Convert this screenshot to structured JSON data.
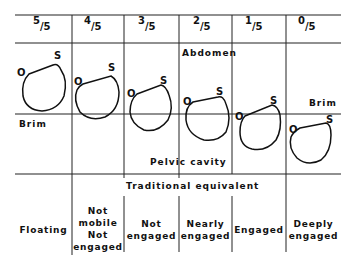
{
  "diagram": {
    "columns": [
      {
        "num": "5",
        "den": "/5",
        "equivalent": [
          "Floating"
        ]
      },
      {
        "num": "4",
        "den": "/5",
        "equivalent": [
          "Not",
          "mobile",
          "Not",
          "engaged"
        ]
      },
      {
        "num": "3",
        "den": "/5",
        "equivalent": [
          "Not",
          "engaged"
        ]
      },
      {
        "num": "2",
        "den": "/5",
        "equivalent": [
          "Nearly",
          "engaged"
        ]
      },
      {
        "num": "1",
        "den": "/5",
        "equivalent": [
          "Engaged"
        ]
      },
      {
        "num": "0",
        "den": "/5",
        "equivalent": [
          "Deeply",
          "engaged"
        ]
      }
    ],
    "labels": {
      "abdomen": "Abdomen",
      "brim_left": "Brim",
      "brim_right": "Brim",
      "pelvic_cavity": "Pelvic cavity",
      "traditional_equivalent": "Traditional equivalent",
      "occiput": "O",
      "sinciput": "S"
    }
  }
}
